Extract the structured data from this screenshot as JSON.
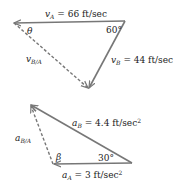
{
  "top_triangle": {
    "vA_label": "v",
    "vA_sub": "A",
    "vA_value": " = 66 ft/sec",
    "vB_label": "v",
    "vB_sub": "B",
    "vB_value": " = 44 ft/sec",
    "vBA_label": "v",
    "vBA_sub": "B/A",
    "angle_theta": "θ",
    "angle_60": "60°"
  },
  "bottom_triangle": {
    "aB_label": "a",
    "aB_sub": "B",
    "aB_value": " = 4.4 ft/sec",
    "aB_exp": "2",
    "aA_label": "a",
    "aA_sub": "A",
    "aA_value": " = 3 ft/sec",
    "aA_exp": "2",
    "aBA_label": "a",
    "aBA_sub": "B/A",
    "angle_beta": "β",
    "angle_30": "30°"
  },
  "colors": {
    "line": "#777777",
    "text": "#222222"
  }
}
